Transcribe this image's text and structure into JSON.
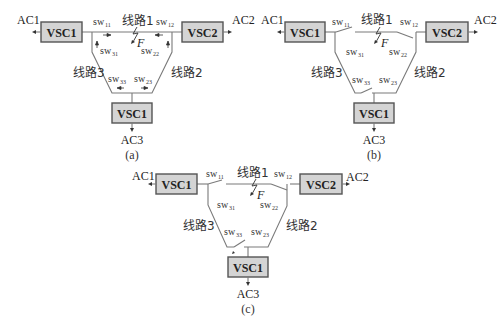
{
  "figure": {
    "panels": [
      {
        "id": "a",
        "caption": "(a)",
        "converters": {
          "left": "VSC1",
          "right": "VSC2",
          "bottom": "VSC1"
        },
        "ac_labels": {
          "left": "AC1",
          "right": "AC2",
          "bottom": "AC3"
        },
        "lines": {
          "line1": "线路1",
          "line2": "线路2",
          "line3": "线路3"
        },
        "switches": {
          "sw11": "sw",
          "sw12": "sw",
          "sw31": "sw",
          "sw22": "sw",
          "sw33": "sw",
          "sw23": "sw"
        },
        "switch_subs": {
          "sw11": "11",
          "sw12": "12",
          "sw31": "31",
          "sw22": "22",
          "sw33": "33",
          "sw23": "23"
        },
        "fault_label": "F",
        "state": "current direction arrows shown"
      },
      {
        "id": "b",
        "caption": "(b)",
        "converters": {
          "left": "VSC1",
          "right": "VSC2",
          "bottom": "VSC1"
        },
        "ac_labels": {
          "left": "AC1",
          "right": "AC2",
          "bottom": "AC3"
        },
        "lines": {
          "line1": "线路1",
          "line2": "线路2",
          "line3": "线路3"
        },
        "switches": {
          "sw11": "sw",
          "sw12": "sw",
          "sw31": "sw",
          "sw22": "sw",
          "sw33": "sw",
          "sw23": "sw"
        },
        "switch_subs": {
          "sw11": "11",
          "sw12": "12",
          "sw31": "31",
          "sw22": "22",
          "sw33": "33",
          "sw23": "23"
        },
        "fault_label": "F",
        "state": "sw11, sw12, sw33 open"
      },
      {
        "id": "c",
        "caption": "(c)",
        "converters": {
          "left": "VSC1",
          "right": "VSC2",
          "bottom": "VSC1"
        },
        "ac_labels": {
          "left": "AC1",
          "right": "AC2",
          "bottom": "AC3"
        },
        "lines": {
          "line1": "线路1",
          "line2": "线路2",
          "line3": "线路3"
        },
        "switches": {
          "sw11": "sw",
          "sw12": "sw",
          "sw31": "sw",
          "sw22": "sw",
          "sw33": "sw",
          "sw23": "sw"
        },
        "switch_subs": {
          "sw11": "11",
          "sw12": "12",
          "sw31": "31",
          "sw22": "22",
          "sw33": "33",
          "sw23": "23"
        },
        "fault_label": "F",
        "state": "sw11, sw12 open; sw33 reclosing"
      }
    ]
  }
}
